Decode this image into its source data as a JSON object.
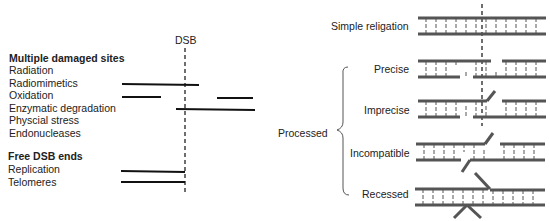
{
  "left_panel": {
    "dsb_label": "DSB",
    "section1_title": "Multiple damaged sites",
    "section1_items": [
      "Radiation",
      "Radiomimetics",
      "Oxidation",
      "Enzymatic degradation",
      "Physcial stress",
      "Endonucleases"
    ],
    "section2_title": "Free DSB ends",
    "section2_items": [
      "Replication",
      "Telomeres"
    ]
  },
  "right_panel": {
    "simple_label": "Simple religation",
    "processed_label": "Processed",
    "processed_items": [
      "Precise",
      "Imprecise",
      "Incompatible",
      "Recessed"
    ]
  },
  "colors": {
    "ink": "#222222",
    "dna": "#555555"
  }
}
